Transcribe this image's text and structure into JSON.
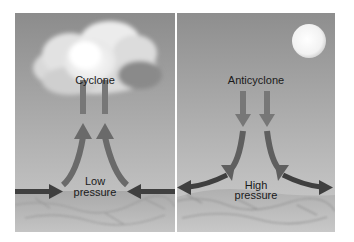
{
  "diagram": {
    "panels": [
      {
        "id": "cyclone",
        "title": "Cyclone",
        "pressure_label_line1": "Low",
        "pressure_label_line2": "pressure",
        "sky_feature": "cloud",
        "airflow": "converging at surface, rising"
      },
      {
        "id": "anticyclone",
        "title": "Anticyclone",
        "pressure_label_line1": "High",
        "pressure_label_line2": "pressure",
        "sky_feature": "sun",
        "airflow": "descending, diverging at surface"
      }
    ],
    "colors": {
      "sky_top": "#8e8e8e",
      "sky_bottom": "#bdbdbd",
      "ground": "#b8b8b8",
      "arrow_vertical": "#767676",
      "arrow_horizontal": "#3e3e3e",
      "sun": "#f4f4f4"
    }
  }
}
